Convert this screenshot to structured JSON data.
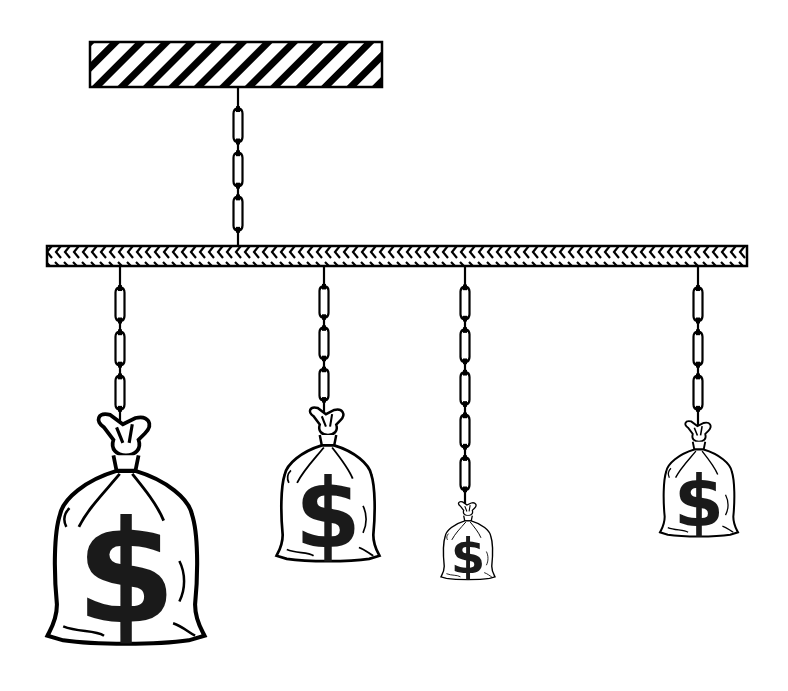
{
  "diagram": {
    "title": "Mobile balance with hanging money bags",
    "colors": {
      "ink": "#000000",
      "paper": "#ffffff",
      "dollar_fill": "#1a1a1a"
    },
    "ceiling": {
      "label": "ceiling-mount",
      "x": 90,
      "y": 42,
      "width": 292,
      "height": 45,
      "pattern": "diagonal-hatch"
    },
    "main_chain": {
      "x": 238,
      "y1": 87,
      "y2": 246,
      "links": 3
    },
    "beam": {
      "label": "balance-beam",
      "x": 47,
      "y": 246,
      "width": 700,
      "height": 20,
      "pattern": "chevron-hatch"
    },
    "hangers": [
      {
        "label": "bag-1-large",
        "x": 120,
        "chain_end": 425,
        "links": 3,
        "bag": {
          "cx": 126,
          "top": 418,
          "width": 157,
          "height": 227,
          "symbol": "$"
        }
      },
      {
        "label": "bag-2-medium",
        "x": 324,
        "chain_end": 415,
        "links": 3,
        "bag": {
          "cx": 328,
          "top": 410,
          "width": 103,
          "height": 152,
          "symbol": "$"
        }
      },
      {
        "label": "bag-3-small",
        "x": 465,
        "chain_end": 505,
        "links": 5,
        "bag": {
          "cx": 468,
          "top": 503,
          "width": 54,
          "height": 77,
          "symbol": "$"
        }
      },
      {
        "label": "bag-4-medium-small",
        "x": 698,
        "chain_end": 425,
        "links": 3,
        "bag": {
          "cx": 699,
          "top": 423,
          "width": 78,
          "height": 114,
          "symbol": "$"
        }
      }
    ]
  }
}
